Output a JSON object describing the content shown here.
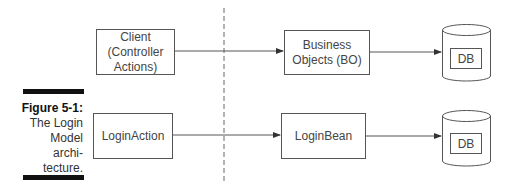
{
  "caption": {
    "title": "Figure 5-1:",
    "lines": [
      "The Login",
      "Model",
      "archi-",
      "tecture."
    ]
  },
  "diagram": {
    "row1": {
      "client": "Client\n(Controller\nActions)",
      "client_lines": [
        "Client",
        "(Controller",
        "Actions)"
      ],
      "business": [
        "Business",
        "Objects (BO)"
      ],
      "db": "DB"
    },
    "row2": {
      "action": "LoginAction",
      "bean": "LoginBean",
      "db": "DB"
    }
  },
  "colors": {
    "stroke": "#555555",
    "bar": "#111111",
    "text": "#444444"
  }
}
